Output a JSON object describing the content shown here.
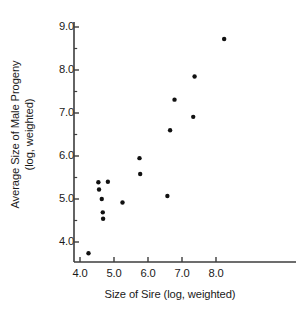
{
  "chart_data": {
    "type": "scatter",
    "title": "",
    "xlabel": "Size of Sire (log, weighted)",
    "ylabel_line1": "Average Size of Male Progeny",
    "ylabel_line2": "(log, weighted)",
    "xlim": [
      3.7,
      8.9
    ],
    "ylim": [
      3.4,
      9.3
    ],
    "xticks": [
      4.0,
      5.0,
      6.0,
      7.0,
      8.0
    ],
    "xtick_labels": [
      "4.0",
      "5.0",
      "6.0",
      "7.0",
      "8.0"
    ],
    "yticks": [
      4.0,
      5.0,
      6.0,
      7.0,
      8.0,
      9.0
    ],
    "ytick_labels": [
      "4.0",
      "5.0",
      "6.0",
      "7.0",
      "8.0",
      "9.0"
    ],
    "x_minor_ticks": [
      4.5,
      5.5,
      6.5,
      7.5,
      8.5
    ],
    "y_minor_ticks": [
      4.5,
      5.5,
      6.5,
      7.5,
      8.5
    ],
    "grid": false,
    "legend": false,
    "marker": "filled-circle",
    "marker_color": "#111111",
    "marker_size_px": 4.4,
    "axis_color": "#3d3d3d",
    "points": [
      {
        "x": 4.25,
        "y": 3.74
      },
      {
        "x": 4.54,
        "y": 5.39
      },
      {
        "x": 4.56,
        "y": 5.22
      },
      {
        "x": 4.64,
        "y": 5.0
      },
      {
        "x": 4.67,
        "y": 4.69
      },
      {
        "x": 4.68,
        "y": 4.54
      },
      {
        "x": 4.82,
        "y": 5.4
      },
      {
        "x": 5.25,
        "y": 4.92
      },
      {
        "x": 5.75,
        "y": 5.95
      },
      {
        "x": 5.77,
        "y": 5.58
      },
      {
        "x": 6.57,
        "y": 5.07
      },
      {
        "x": 6.65,
        "y": 6.6
      },
      {
        "x": 6.78,
        "y": 7.31
      },
      {
        "x": 7.33,
        "y": 6.91
      },
      {
        "x": 7.37,
        "y": 7.85
      },
      {
        "x": 8.24,
        "y": 8.72
      }
    ]
  },
  "axes": {
    "x_axis_name": "x-axis",
    "y_axis_name": "y-axis"
  }
}
